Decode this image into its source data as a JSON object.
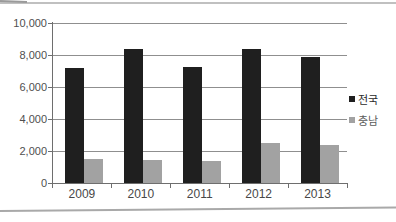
{
  "chart_data": {
    "type": "bar",
    "title": "",
    "xlabel": "",
    "ylabel": "",
    "categories": [
      "2009",
      "2010",
      "2011",
      "2012",
      "2013"
    ],
    "series": [
      {
        "name": "전국",
        "color": "#1f1f1f",
        "values": [
          7200,
          8350,
          7250,
          8400,
          7850
        ]
      },
      {
        "name": "충남",
        "color": "#a2a2a2",
        "values": [
          1500,
          1450,
          1350,
          2500,
          2350
        ]
      }
    ],
    "ylim": [
      0,
      10000
    ],
    "ytick_step": 2000,
    "ytick_labels": [
      "0",
      "2,000",
      "4,000",
      "6,000",
      "8,000",
      "10,000"
    ],
    "grid": true,
    "gridline_color": "#8f8f8f",
    "axis_color": "#6e6e6e",
    "legend_position": "right-middle"
  },
  "page": {
    "background": "#ffffff"
  }
}
